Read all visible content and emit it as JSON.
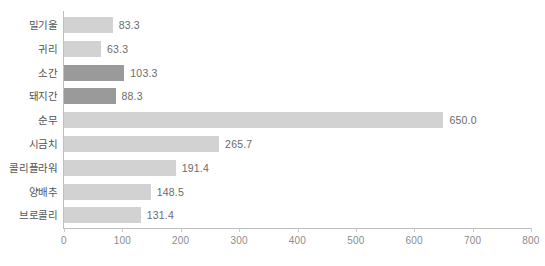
{
  "chart_data": {
    "type": "bar",
    "orientation": "horizontal",
    "title": "",
    "xlabel": "",
    "ylabel": "",
    "xlim": [
      0,
      800
    ],
    "xticks": [
      0,
      100,
      200,
      300,
      400,
      500,
      600,
      700,
      800
    ],
    "xtick_labels": [
      "0",
      "100",
      "200",
      "300",
      "400",
      "500",
      "600",
      "700",
      "800"
    ],
    "grid": false,
    "legend": "none",
    "categories": [
      "밀기울",
      "귀리",
      "소간",
      "돼지간",
      "순무",
      "시금치",
      "콜리플라워",
      "양배추",
      "브로콜리"
    ],
    "values": [
      83.3,
      63.3,
      103.3,
      88.3,
      650.0,
      265.7,
      191.4,
      148.5,
      131.4
    ],
    "value_labels": [
      "83.3",
      "63.3",
      "103.3",
      "88.3",
      "650.0",
      "265.7",
      "191.4",
      "148.5",
      "131.4"
    ],
    "bar_shades": [
      "light",
      "light",
      "dark",
      "dark",
      "light",
      "light",
      "light",
      "light",
      "light"
    ]
  },
  "colors": {
    "bar_light": "#d2d2d2",
    "bar_dark": "#9a9a9a",
    "axis": "#bfbfbf",
    "tick_text": "#8c8c8c",
    "category_text": "#555555",
    "value_text": "#6b6b6b",
    "background": "#ffffff"
  },
  "title_remnant": "················"
}
